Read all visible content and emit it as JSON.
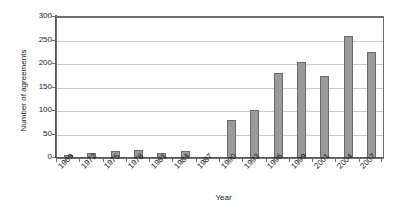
{
  "chart_data": {
    "type": "bar",
    "title": "",
    "xlabel": "Year",
    "ylabel": "Number of agreements",
    "categories": [
      "1969",
      "1972",
      "1975",
      "1978",
      "1981",
      "1984",
      "1987",
      "1990",
      "1993",
      "1996",
      "1999",
      "2001",
      "2004",
      "2007"
    ],
    "values": [
      6,
      10,
      15,
      16,
      10,
      15,
      0,
      80,
      102,
      180,
      205,
      175,
      260,
      225
    ],
    "ylim": [
      0,
      300
    ],
    "yticks": [
      0,
      50,
      100,
      150,
      200,
      250,
      300
    ],
    "ytick_labels": [
      "0",
      "50",
      "100",
      "150",
      "200",
      "250",
      "300"
    ],
    "grid": true,
    "legend": false,
    "bar_color": "#9a9a9a",
    "bar_edge_color": "#6b6b6b",
    "gridline_color": "#c8c8c8",
    "axis_color": "#595959"
  }
}
